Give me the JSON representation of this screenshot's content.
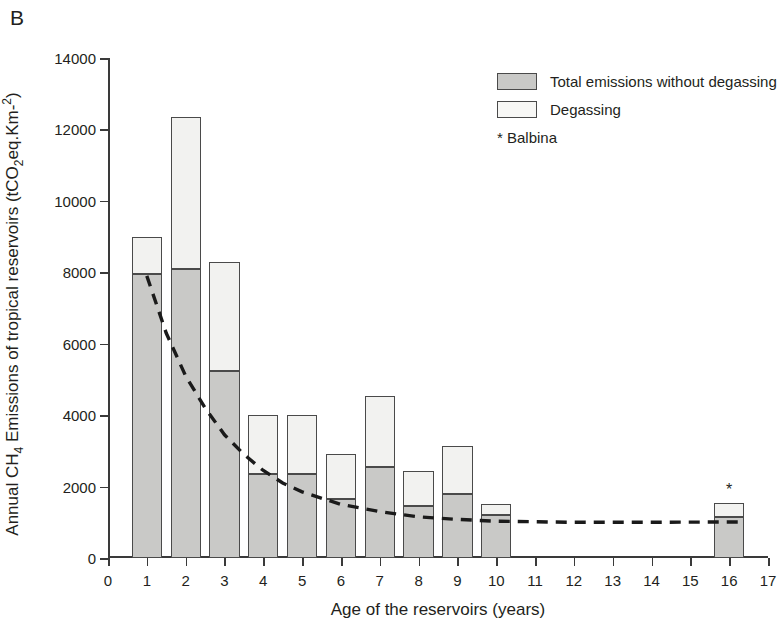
{
  "panel_label": "B",
  "legend": {
    "items": [
      {
        "label": "Total emissions without degassing",
        "swatch": "gray"
      },
      {
        "label": "Degassing",
        "swatch": "white"
      }
    ],
    "note": "* Balbina"
  },
  "axes": {
    "y_title_prefix": "Annual CH",
    "y_title_sub1": "4",
    "y_title_mid": " Emissions of tropical reservoirs (tCO",
    "y_title_sub2": "2",
    "y_title_suffix": "eq.Km-",
    "y_title_sup": "2",
    "y_title_close": ")",
    "x_title": "Age of the reservoirs (years)",
    "y_ticks": [
      "0",
      "2000",
      "4000",
      "6000",
      "8000",
      "10000",
      "12000",
      "14000"
    ],
    "x_ticks": [
      "0",
      "1",
      "2",
      "3",
      "4",
      "5",
      "6",
      "7",
      "8",
      "9",
      "10",
      "11",
      "12",
      "13",
      "14",
      "15",
      "16",
      "17"
    ]
  },
  "chart_data": {
    "type": "bar",
    "title": "B",
    "xlabel": "Age of the reservoirs (years)",
    "ylabel": "Annual CH4 Emissions of tropical reservoirs (tCO2eq.Km-2)",
    "xlim": [
      0,
      17
    ],
    "ylim": [
      0,
      14000
    ],
    "ytick_step": 2000,
    "grid": false,
    "stacked": true,
    "legend_position": "top-right",
    "categories": [
      1,
      2,
      3,
      4,
      5,
      6,
      7,
      8,
      9,
      10,
      16
    ],
    "series": [
      {
        "name": "Total emissions without degassing",
        "color": "#c9c9c7",
        "values": [
          7950,
          8100,
          5250,
          2350,
          2350,
          1650,
          2550,
          1450,
          1800,
          1200,
          1150
        ]
      },
      {
        "name": "Degassing",
        "color": "#f2f2f0",
        "values": [
          1050,
          4250,
          3050,
          1650,
          1650,
          1250,
          2000,
          1000,
          1350,
          300,
          400
        ]
      }
    ],
    "totals": [
      9000,
      12350,
      8300,
      4000,
      4000,
      2900,
      4550,
      2450,
      3150,
      1500,
      1550
    ],
    "annotations": [
      {
        "text": "*",
        "x": 16,
        "y": 1550,
        "note": "Balbina"
      }
    ],
    "trendline": {
      "type": "exponential-decay-dashed",
      "style": "dashed",
      "color": "#1a1a1a",
      "points": [
        {
          "x": 1,
          "y": 7900
        },
        {
          "x": 1.5,
          "y": 6300
        },
        {
          "x": 2,
          "y": 5100
        },
        {
          "x": 2.5,
          "y": 4200
        },
        {
          "x": 3,
          "y": 3450
        },
        {
          "x": 3.5,
          "y": 2900
        },
        {
          "x": 4,
          "y": 2450
        },
        {
          "x": 4.5,
          "y": 2100
        },
        {
          "x": 5,
          "y": 1850
        },
        {
          "x": 6,
          "y": 1500
        },
        {
          "x": 7,
          "y": 1300
        },
        {
          "x": 8,
          "y": 1150
        },
        {
          "x": 9,
          "y": 1080
        },
        {
          "x": 10,
          "y": 1030
        },
        {
          "x": 12,
          "y": 1000
        },
        {
          "x": 14,
          "y": 1000
        },
        {
          "x": 16.4,
          "y": 1010
        }
      ]
    }
  }
}
